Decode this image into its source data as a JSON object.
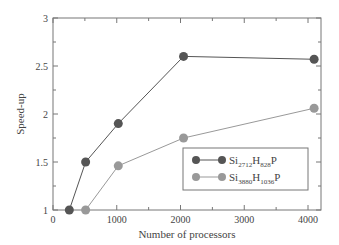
{
  "chart_data": {
    "type": "line",
    "title": "",
    "xlabel": "Number of processors",
    "ylabel": "Speed-up",
    "xlim": [
      0,
      4200
    ],
    "ylim": [
      1,
      3
    ],
    "xticks": [
      0,
      1000,
      2000,
      3000,
      4000
    ],
    "xtick_labels": [
      "0",
      "1000",
      "2000",
      "3000",
      "4000"
    ],
    "yticks": [
      1,
      1.5,
      2,
      2.5,
      3
    ],
    "ytick_labels": [
      "1",
      "1.5",
      "2",
      "2.5",
      "3"
    ],
    "grid": false,
    "legend_position": "lower right",
    "series": [
      {
        "name": "Si2712H828P",
        "label_base": "Si",
        "sub1": "2712",
        "mid": "H",
        "sub2": "828",
        "tail": "P",
        "color": "#555555",
        "x": [
          256,
          512,
          1024,
          2048,
          4096
        ],
        "values": [
          1.0,
          1.5,
          1.9,
          2.6,
          2.57
        ]
      },
      {
        "name": "Si3880H1036P",
        "label_base": "Si",
        "sub1": "3880",
        "mid": "H",
        "sub2": "1036",
        "tail": "P",
        "color": "#999999",
        "x": [
          512,
          1024,
          2048,
          4096
        ],
        "values": [
          1.0,
          1.46,
          1.75,
          2.06
        ]
      }
    ]
  }
}
